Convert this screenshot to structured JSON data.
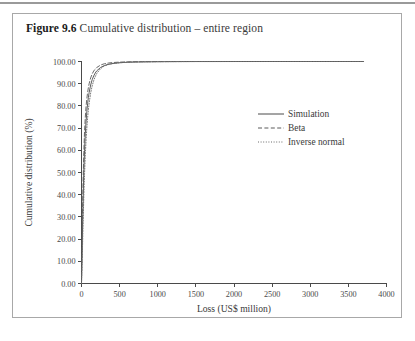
{
  "figure": {
    "label": "Figure 9.6",
    "caption": "Cumulative distribution – entire region"
  },
  "chart_data": {
    "type": "line",
    "title": "Cumulative distribution – entire region",
    "xlabel": "Loss (US$ million)",
    "ylabel": "Cumulative distribution (%)",
    "xlim": [
      0,
      4000
    ],
    "ylim": [
      0,
      100
    ],
    "xticks": [
      0,
      500,
      1000,
      1500,
      2000,
      2500,
      3000,
      3500,
      4000
    ],
    "xticklabels": [
      "0",
      "500",
      "1000",
      "1500",
      "2000",
      "2500",
      "3000",
      "3500",
      "4000"
    ],
    "yticks": [
      0,
      10,
      20,
      30,
      40,
      50,
      60,
      70,
      80,
      90,
      100
    ],
    "yticklabels": [
      "0.00",
      "10.00",
      "20.00",
      "30.00",
      "40.00",
      "50.00",
      "60.00",
      "70.00",
      "80.00",
      "90.00",
      "100.00"
    ],
    "grid": false,
    "legend_position": "center-right",
    "series": [
      {
        "name": "Simulation",
        "style": "solid",
        "color": "#4a4a4a",
        "x": [
          0,
          10,
          20,
          30,
          40,
          50,
          60,
          70,
          80,
          90,
          100,
          120,
          140,
          160,
          180,
          200,
          250,
          300,
          350,
          400,
          500,
          600,
          700,
          800,
          1000,
          1200,
          1500,
          2000,
          2500,
          3000,
          3700
        ],
        "y": [
          0.0,
          18.0,
          36.0,
          50.0,
          60.0,
          67.5,
          73.0,
          77.5,
          81.0,
          83.8,
          86.0,
          89.4,
          91.8,
          93.5,
          94.8,
          95.8,
          97.3,
          98.2,
          98.7,
          99.05,
          99.45,
          99.65,
          99.76,
          99.83,
          99.91,
          99.95,
          99.98,
          99.99,
          100.0,
          100.0,
          100.0
        ]
      },
      {
        "name": "Beta",
        "style": "dashed",
        "color": "#5a5a5a",
        "x": [
          0,
          10,
          20,
          30,
          40,
          50,
          60,
          70,
          80,
          90,
          100,
          120,
          140,
          160,
          180,
          200,
          250,
          300,
          350,
          400,
          500,
          600,
          700,
          800,
          1000,
          1200,
          1500,
          2000,
          2500,
          3000,
          3700
        ],
        "y": [
          0.0,
          25.0,
          45.0,
          59.0,
          68.5,
          75.0,
          79.8,
          83.3,
          86.0,
          88.2,
          90.0,
          92.6,
          94.4,
          95.7,
          96.6,
          97.3,
          98.4,
          99.0,
          99.3,
          99.5,
          99.73,
          99.84,
          99.9,
          99.93,
          99.97,
          99.99,
          100.0,
          100.0,
          100.0,
          100.0,
          100.0
        ]
      },
      {
        "name": "Inverse normal",
        "style": "dotted",
        "color": "#6a6a6a",
        "x": [
          0,
          10,
          20,
          30,
          40,
          50,
          60,
          70,
          80,
          90,
          100,
          120,
          140,
          160,
          180,
          200,
          250,
          300,
          350,
          400,
          500,
          600,
          700,
          800,
          1000,
          1200,
          1500,
          2000,
          2500,
          3000,
          3700
        ],
        "y": [
          0.0,
          12.0,
          26.0,
          39.0,
          49.5,
          58.0,
          64.8,
          70.2,
          74.6,
          78.2,
          81.2,
          85.8,
          89.0,
          91.4,
          93.2,
          94.6,
          96.8,
          98.0,
          98.6,
          99.0,
          99.45,
          99.66,
          99.78,
          99.85,
          99.93,
          99.96,
          99.985,
          99.995,
          100.0,
          100.0,
          100.0
        ]
      }
    ]
  },
  "legend": {
    "entries": [
      {
        "label": "Simulation",
        "style": "solid"
      },
      {
        "label": "Beta",
        "style": "dashed"
      },
      {
        "label": "Inverse normal",
        "style": "dotted"
      }
    ]
  }
}
